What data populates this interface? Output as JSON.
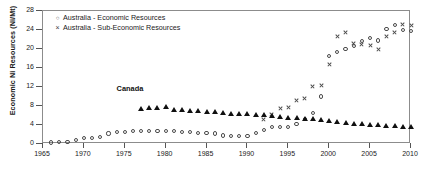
{
  "chart_data": {
    "type": "scatter",
    "title": "",
    "xlabel": "",
    "ylabel": "Economic Ni Resources (Ni/Mt)",
    "xlim": [
      1965,
      2010
    ],
    "ylim": [
      0,
      28
    ],
    "xticks": [
      1965,
      1970,
      1975,
      1980,
      1985,
      1990,
      1995,
      2000,
      2005,
      2010
    ],
    "yticks": [
      0,
      4,
      8,
      12,
      16,
      20,
      24,
      28
    ],
    "grid": false,
    "legend_position": "top-left",
    "annotations": [
      {
        "text": "Canada",
        "x": 1974,
        "y": 11.6
      }
    ],
    "series": [
      {
        "name": "Australia - Economic Resources",
        "marker": "circle-open",
        "color": "#4a4a4a",
        "points": [
          [
            1966,
            0.3
          ],
          [
            1967,
            0.4
          ],
          [
            1968,
            0.5
          ],
          [
            1969,
            0.9
          ],
          [
            1970,
            1.2
          ],
          [
            1971,
            1.3
          ],
          [
            1972,
            1.5
          ],
          [
            1973,
            2.2
          ],
          [
            1974,
            2.5
          ],
          [
            1975,
            2.6
          ],
          [
            1976,
            2.7
          ],
          [
            1977,
            2.8
          ],
          [
            1978,
            2.8
          ],
          [
            1979,
            2.8
          ],
          [
            1980,
            2.8
          ],
          [
            1981,
            2.7
          ],
          [
            1982,
            2.6
          ],
          [
            1983,
            2.5
          ],
          [
            1984,
            2.4
          ],
          [
            1985,
            2.3
          ],
          [
            1986,
            2.2
          ],
          [
            1987,
            1.8
          ],
          [
            1988,
            1.6
          ],
          [
            1989,
            1.6
          ],
          [
            1990,
            1.6
          ],
          [
            1991,
            2.4
          ],
          [
            1992,
            3.0
          ],
          [
            1993,
            3.6
          ],
          [
            1994,
            3.5
          ],
          [
            1995,
            3.6
          ],
          [
            1996,
            4.2
          ],
          [
            1997,
            5.2
          ],
          [
            1998,
            6.6
          ],
          [
            1999,
            10.0
          ],
          [
            2000,
            18.6
          ],
          [
            2001,
            19.4
          ],
          [
            2002,
            20.0
          ],
          [
            2003,
            20.6
          ],
          [
            2004,
            21.6
          ],
          [
            2005,
            22.3
          ],
          [
            2006,
            21.8
          ],
          [
            2007,
            24.2
          ],
          [
            2008,
            25.0
          ],
          [
            2009,
            24.0
          ],
          [
            2010,
            23.8
          ]
        ]
      },
      {
        "name": "Australia - Sub-Economic Resources",
        "marker": "cross",
        "color": "#4a4a4a",
        "points": [
          [
            1992,
            5.2
          ],
          [
            1993,
            6.2
          ],
          [
            1994,
            7.4
          ],
          [
            1995,
            7.6
          ],
          [
            1996,
            9.2
          ],
          [
            1997,
            9.6
          ],
          [
            1998,
            12.2
          ],
          [
            1999,
            12.4
          ],
          [
            2000,
            16.8
          ],
          [
            2001,
            22.6
          ],
          [
            2002,
            23.4
          ],
          [
            2003,
            21.2
          ],
          [
            2004,
            21.0
          ],
          [
            2005,
            20.8
          ],
          [
            2006,
            20.0
          ],
          [
            2007,
            22.6
          ],
          [
            2008,
            23.4
          ],
          [
            2009,
            25.2
          ],
          [
            2010,
            24.9
          ]
        ]
      },
      {
        "name": "Canada",
        "marker": "triangle-filled",
        "color": "#101010",
        "points": [
          [
            1977,
            7.5
          ],
          [
            1978,
            7.6
          ],
          [
            1979,
            7.6
          ],
          [
            1980,
            7.8
          ],
          [
            1981,
            7.3
          ],
          [
            1982,
            7.2
          ],
          [
            1983,
            7.1
          ],
          [
            1984,
            7.0
          ],
          [
            1985,
            6.9
          ],
          [
            1986,
            6.8
          ],
          [
            1987,
            6.6
          ],
          [
            1988,
            6.5
          ],
          [
            1989,
            6.4
          ],
          [
            1990,
            6.3
          ],
          [
            1991,
            6.2
          ],
          [
            1992,
            6.1
          ],
          [
            1993,
            6.0
          ],
          [
            1994,
            5.8
          ],
          [
            1995,
            5.6
          ],
          [
            1996,
            5.5
          ],
          [
            1997,
            5.4
          ],
          [
            1998,
            5.3
          ],
          [
            1999,
            5.2
          ],
          [
            2000,
            5.0
          ],
          [
            2001,
            4.8
          ],
          [
            2002,
            4.6
          ],
          [
            2003,
            4.4
          ],
          [
            2004,
            4.2
          ],
          [
            2005,
            4.1
          ],
          [
            2006,
            4.0
          ],
          [
            2007,
            3.9
          ],
          [
            2008,
            3.8
          ],
          [
            2009,
            3.7
          ],
          [
            2010,
            3.6
          ]
        ]
      }
    ]
  },
  "legend": {
    "entries": [
      {
        "marker": "o",
        "label": "Australia - Economic Resources"
      },
      {
        "marker": "×",
        "label": "Australia - Sub-Economic Resources"
      }
    ]
  }
}
